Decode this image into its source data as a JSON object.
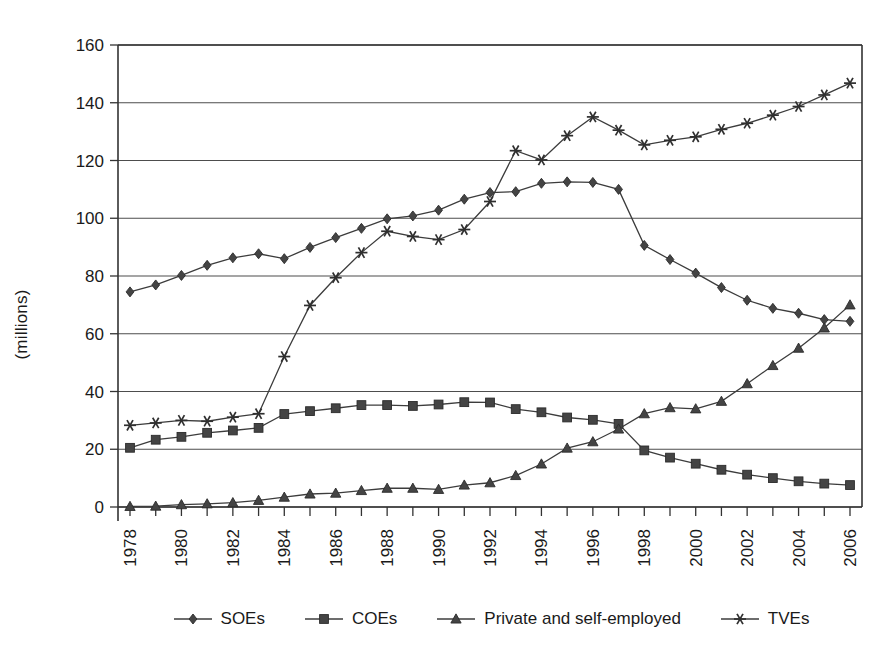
{
  "chart_data": {
    "type": "line",
    "title": "",
    "xlabel": "",
    "ylabel": "(millions)",
    "ylim": [
      0,
      160
    ],
    "ytick_step": 20,
    "yticks": [
      0,
      20,
      40,
      60,
      80,
      100,
      120,
      140,
      160
    ],
    "xticks_labeled": [
      "1978",
      "1980",
      "1982",
      "1984",
      "1986",
      "1988",
      "1990",
      "1992",
      "1994",
      "1996",
      "1998",
      "2000",
      "2002",
      "2004",
      "2006"
    ],
    "grid": "horizontal",
    "legend_position": "bottom",
    "x": [
      1978,
      1979,
      1980,
      1981,
      1982,
      1983,
      1984,
      1985,
      1986,
      1987,
      1988,
      1989,
      1990,
      1991,
      1992,
      1993,
      1994,
      1995,
      1996,
      1997,
      1998,
      1999,
      2000,
      2001,
      2002,
      2003,
      2004,
      2005,
      2006
    ],
    "series": [
      {
        "name": "SOEs",
        "marker": "diamond",
        "values": [
          74.5,
          76.9,
          80.2,
          83.7,
          86.3,
          87.7,
          86.0,
          89.9,
          93.3,
          96.5,
          99.8,
          100.8,
          102.8,
          106.6,
          108.9,
          109.2,
          112.1,
          112.6,
          112.4,
          110.0,
          90.6,
          85.7,
          81.0,
          76.0,
          71.6,
          68.8,
          67.1,
          64.9,
          64.3
        ]
      },
      {
        "name": "COEs",
        "marker": "square",
        "values": [
          20.5,
          23.3,
          24.3,
          25.7,
          26.5,
          27.4,
          32.2,
          33.2,
          34.2,
          35.3,
          35.3,
          35.0,
          35.5,
          36.3,
          36.2,
          33.9,
          32.8,
          31.0,
          30.2,
          28.8,
          19.6,
          17.1,
          15.0,
          12.9,
          11.2,
          10.0,
          8.9,
          8.1,
          7.6
        ]
      },
      {
        "name": "Private and self-employed",
        "marker": "triangle",
        "values": [
          0.2,
          0.3,
          0.8,
          1.1,
          1.5,
          2.3,
          3.4,
          4.5,
          4.8,
          5.7,
          6.5,
          6.5,
          6.1,
          7.6,
          8.4,
          10.9,
          14.9,
          20.4,
          22.6,
          27.0,
          32.3,
          34.4,
          34.0,
          36.6,
          42.7,
          49.0,
          55.0,
          62.0,
          70.0
        ]
      },
      {
        "name": "TVEs",
        "marker": "star",
        "values": [
          28.3,
          29.1,
          30.0,
          29.7,
          31.1,
          32.3,
          52.1,
          69.8,
          79.4,
          88.1,
          95.5,
          93.7,
          92.6,
          96.1,
          105.8,
          123.4,
          120.2,
          128.6,
          135.1,
          130.5,
          125.4,
          127.0,
          128.2,
          130.8,
          132.9,
          135.7,
          138.7,
          142.7,
          146.8
        ]
      }
    ]
  },
  "legend": {
    "items": [
      {
        "label": "SOEs",
        "marker": "diamond"
      },
      {
        "label": "COEs",
        "marker": "square"
      },
      {
        "label": "Private and self-employed",
        "marker": "triangle"
      },
      {
        "label": "TVEs",
        "marker": "star"
      }
    ]
  },
  "axis": {
    "y_title": "(millions)"
  }
}
